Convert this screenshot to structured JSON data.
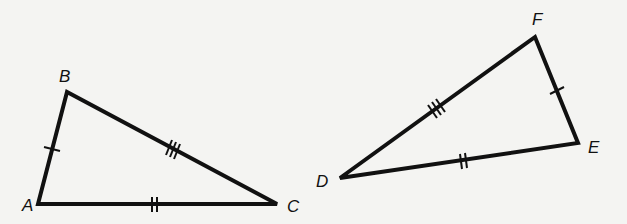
{
  "diagram": {
    "type": "congruent-triangles",
    "stroke_color": "#111111",
    "background": "#f4f4f2",
    "triangles": [
      {
        "name": "ABC",
        "vertices": {
          "A": {
            "label": "A",
            "x": 38,
            "y": 204,
            "lx": 22,
            "ly": 211
          },
          "B": {
            "label": "B",
            "x": 67,
            "y": 92,
            "lx": 59,
            "ly": 82
          },
          "C": {
            "label": "C",
            "x": 277,
            "y": 204,
            "lx": 287,
            "ly": 212
          }
        },
        "sides": [
          {
            "from": "A",
            "to": "B",
            "ticks": 1
          },
          {
            "from": "B",
            "to": "C",
            "ticks": 3
          },
          {
            "from": "A",
            "to": "C",
            "ticks": 2
          }
        ]
      },
      {
        "name": "DEF",
        "vertices": {
          "D": {
            "label": "D",
            "x": 340,
            "y": 178,
            "lx": 316,
            "ly": 187
          },
          "E": {
            "label": "E",
            "x": 578,
            "y": 143,
            "lx": 588,
            "ly": 153
          },
          "F": {
            "label": "F",
            "x": 535,
            "y": 37,
            "lx": 532,
            "ly": 25
          }
        },
        "sides": [
          {
            "from": "D",
            "to": "F",
            "ticks": 3
          },
          {
            "from": "F",
            "to": "E",
            "ticks": 1
          },
          {
            "from": "D",
            "to": "E",
            "ticks": 2
          }
        ]
      }
    ],
    "labels": {
      "A": "A",
      "B": "B",
      "C": "C",
      "D": "D",
      "E": "E",
      "F": "F"
    }
  }
}
